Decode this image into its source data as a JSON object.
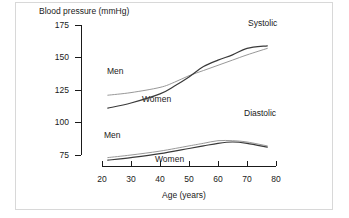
{
  "chart_data": {
    "type": "line",
    "title": "",
    "ylabel": "Blood pressure (mmHg)",
    "xlabel": "Age (years)",
    "xlim": [
      20,
      80
    ],
    "ylim": [
      70,
      175
    ],
    "yticks": [
      "75",
      "100",
      "125",
      "150",
      "175"
    ],
    "ytick_values": [
      75,
      100,
      125,
      150,
      175
    ],
    "xticks": [
      "20",
      "30",
      "40",
      "50",
      "60",
      "70",
      "80"
    ],
    "xtick_values": [
      20,
      30,
      40,
      50,
      60,
      70,
      80
    ],
    "grid": false,
    "legend": "inline-annotations",
    "annotations": [
      {
        "text": "Systolic",
        "x": 72,
        "y": 172
      },
      {
        "text": "Diastolic",
        "x": 71,
        "y": 101
      },
      {
        "text": "Men",
        "x": 30,
        "y": 130
      },
      {
        "text": "Women",
        "x": 42,
        "y": 106
      },
      {
        "text": "Men",
        "x": 29,
        "y": 88
      },
      {
        "text": "Women",
        "x": 45,
        "y": 70
      }
    ],
    "series": [
      {
        "name": "Systolic Men",
        "measure": "Systolic",
        "sex": "Men",
        "x": [
          22,
          30,
          40,
          45,
          50,
          55,
          60,
          65,
          70,
          77
        ],
        "values": [
          121,
          123,
          127,
          131,
          136,
          140,
          144,
          148,
          152,
          157
        ]
      },
      {
        "name": "Systolic Women",
        "measure": "Systolic",
        "sex": "Women",
        "x": [
          22,
          30,
          40,
          45,
          50,
          55,
          60,
          65,
          70,
          77
        ],
        "values": [
          111,
          115,
          122,
          128,
          135,
          143,
          148,
          152,
          157,
          159
        ]
      },
      {
        "name": "Diastolic Men",
        "measure": "Diastolic",
        "sex": "Men",
        "x": [
          22,
          30,
          40,
          50,
          55,
          60,
          65,
          70,
          77
        ],
        "values": [
          73,
          75,
          78,
          82,
          84,
          86,
          86,
          85,
          82
        ]
      },
      {
        "name": "Diastolic Women",
        "measure": "Diastolic",
        "sex": "Women",
        "x": [
          22,
          30,
          40,
          50,
          55,
          60,
          65,
          70,
          77
        ],
        "values": [
          71,
          73,
          76,
          80,
          82,
          84,
          85,
          84,
          81
        ]
      }
    ]
  },
  "figure": {
    "ylabel": "Blood pressure (mmHg)",
    "xlabel": "Age (years)",
    "yticks": [
      "175",
      "150",
      "125",
      "100",
      "75"
    ],
    "xticks": [
      "20",
      "30",
      "40",
      "50",
      "60",
      "70",
      "80"
    ],
    "label_systolic": "Systolic",
    "label_diastolic": "Diastolic",
    "label_men_systolic": "Men",
    "label_women_systolic": "Women",
    "label_men_diastolic": "Men",
    "label_women_diastolic": "Women"
  },
  "colors": {
    "background": "#ffffff",
    "axis": "#1a1a1a",
    "line_dark": "#3a3a3a",
    "line_light": "#8c8c8c",
    "border": "#d8d8d8"
  }
}
